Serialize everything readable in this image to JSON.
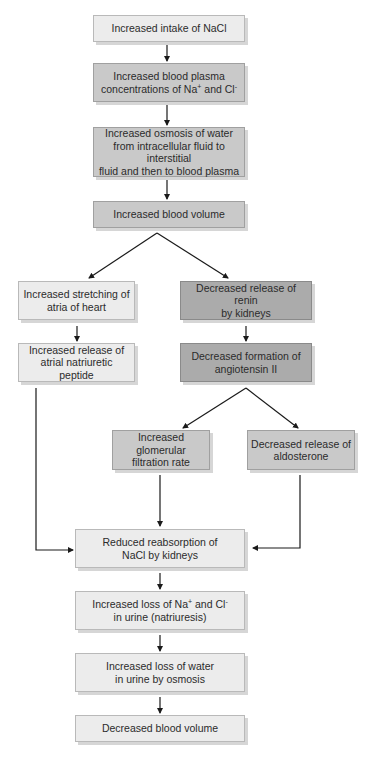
{
  "diagram": {
    "type": "flowchart",
    "nodes": [
      {
        "id": "n1",
        "text": "Increased intake of NaCl",
        "shade": "light"
      },
      {
        "id": "n2",
        "text": "Increased blood plasma concentrations of Na+ and Cl-",
        "line1": "Increased blood plasma",
        "line2a": "concentrations of Na",
        "sup1": "+",
        "line2b": " and Cl",
        "sup2": "-",
        "shade": "medium"
      },
      {
        "id": "n3",
        "line1": "Increased osmosis of water",
        "line2": "from intracellular fluid to interstitial",
        "line3": "fluid and then to blood plasma",
        "shade": "medium"
      },
      {
        "id": "n4",
        "text": "Increased blood volume",
        "shade": "medium"
      },
      {
        "id": "n5",
        "line1": "Increased stretching of",
        "line2": "atria of heart",
        "shade": "light"
      },
      {
        "id": "n6",
        "line1": "Decreased release of renin",
        "line2": "by kidneys",
        "shade": "dark"
      },
      {
        "id": "n7",
        "line1": "Increased release of",
        "line2": "atrial natriuretic peptide",
        "shade": "light"
      },
      {
        "id": "n8",
        "line1": "Decreased formation of",
        "line2": "angiotensin II",
        "shade": "dark"
      },
      {
        "id": "n9",
        "line1": "Increased glomerular",
        "line2": "filtration rate",
        "shade": "medium"
      },
      {
        "id": "n10",
        "line1": "Decreased release of",
        "line2": "aldosterone",
        "shade": "medium"
      },
      {
        "id": "n11",
        "line1": "Reduced reabsorption of",
        "line2": "NaCl by kidneys",
        "shade": "light"
      },
      {
        "id": "n12",
        "line1a": "Increased loss of Na",
        "sup1": "+",
        "line1b": " and Cl",
        "sup2": "-",
        "line2": "in urine (natriuresis)",
        "shade": "light"
      },
      {
        "id": "n13",
        "line1": "Increased loss of water",
        "line2": "in urine by osmosis",
        "shade": "light"
      },
      {
        "id": "n14",
        "text": "Decreased blood volume",
        "shade": "light"
      }
    ],
    "edges": [
      [
        "n1",
        "n2"
      ],
      [
        "n2",
        "n3"
      ],
      [
        "n3",
        "n4"
      ],
      [
        "n4",
        "n5"
      ],
      [
        "n4",
        "n6"
      ],
      [
        "n5",
        "n7"
      ],
      [
        "n6",
        "n8"
      ],
      [
        "n8",
        "n9"
      ],
      [
        "n8",
        "n10"
      ],
      [
        "n7",
        "n11"
      ],
      [
        "n9",
        "n11"
      ],
      [
        "n10",
        "n11"
      ],
      [
        "n11",
        "n12"
      ],
      [
        "n12",
        "n13"
      ],
      [
        "n13",
        "n14"
      ]
    ],
    "colors": {
      "light": "#ececec",
      "medium": "#c9c9c9",
      "dark": "#ababab",
      "arrow": "#1a1a1a"
    }
  }
}
